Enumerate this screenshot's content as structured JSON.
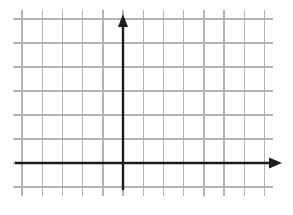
{
  "figure": {
    "width": 293,
    "height": 215,
    "background_color": "#ffffff"
  },
  "chart_data": {
    "type": "scatter",
    "title": "",
    "subtitle": "",
    "xlabel": "",
    "ylabel": "",
    "series": [],
    "x": [],
    "values": [],
    "annotations": [],
    "legend": {
      "entries": [],
      "position": "none"
    },
    "grid": {
      "visible": true,
      "color": "#b4b4b4",
      "line_width": 1.4,
      "vertical_line_x": [
        22,
        42.2,
        62.4,
        82.6,
        102.8,
        123,
        143.2,
        163.4,
        183.6,
        203.8,
        224,
        244.2,
        264.4
      ],
      "horizontal_line_y": [
        19,
        43,
        67,
        91,
        115,
        139,
        163,
        187
      ],
      "cell_width": 20.2,
      "cell_height": 24,
      "columns": 12,
      "rows": 7
    },
    "axes": {
      "color": "#1c1c1c",
      "line_width": 2.4,
      "origin_px": {
        "x": 123,
        "y": 163
      },
      "x_axis": {
        "name": "x-axis",
        "start_px": {
          "x": 15,
          "y": 163
        },
        "end_px": {
          "x": 282,
          "y": 163
        },
        "arrow": "right",
        "tick_labels": [],
        "label": ""
      },
      "y_axis": {
        "name": "y-axis",
        "start_px": {
          "x": 123,
          "y": 190
        },
        "end_px": {
          "x": 123,
          "y": 14
        },
        "arrow": "up",
        "tick_labels": [],
        "label": ""
      },
      "quadrant_extent": {
        "x_left_cells": 5,
        "x_right_cells": 7,
        "y_above_cells": 6,
        "y_below_cells": 1
      }
    },
    "xlim": [
      -5,
      7
    ],
    "ylim": [
      -1,
      6
    ]
  }
}
